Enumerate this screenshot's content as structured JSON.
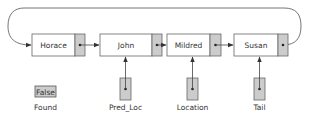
{
  "nodes": [
    {
      "info": "Horace"
    },
    {
      "info": "John"
    },
    {
      "info": "Mildred"
    },
    {
      "info": "Susan"
    }
  ],
  "pointers": [
    {
      "label": "Pred_Loc",
      "target_node": 1
    },
    {
      "label": "Location",
      "target_node": 2
    },
    {
      "label": "Tail",
      "target_node": 3
    }
  ],
  "flag": {
    "label": "Found",
    "value": "False"
  },
  "colors": {
    "stroke": "#555555",
    "node_fill": "#ffffff",
    "link_fill": "#cccccc",
    "text": "#333333"
  }
}
